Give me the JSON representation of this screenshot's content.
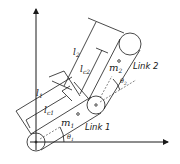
{
  "diagram": {
    "labels": {
      "link1": "Link 1",
      "link2": "Link 2",
      "l1": "l",
      "l1_sub": "1",
      "lc1": "l",
      "lc1_sub": "c1",
      "l2": "l",
      "l2_sub": "2",
      "lc2": "l",
      "lc2_sub": "c2",
      "m1": "m",
      "m1_sub": "1",
      "m2": "m",
      "m2_sub": "2",
      "theta1": "θ",
      "theta1_sub": "1",
      "theta2": "θ",
      "theta2_sub": "2"
    },
    "colors": {
      "stroke": "#1a1a1a",
      "background": "#ffffff"
    }
  }
}
